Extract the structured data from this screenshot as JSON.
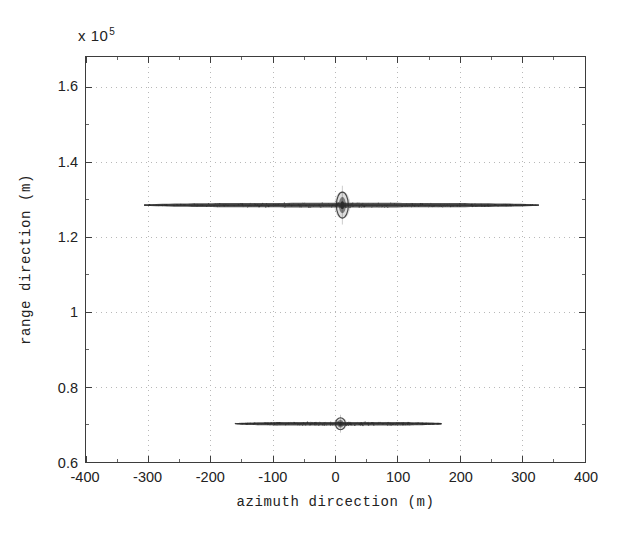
{
  "figure": {
    "title": "",
    "exponent_prefix": "x 10",
    "exponent_power": "5",
    "background_color": "#ffffff",
    "axis_color": "#3d3d3d",
    "grid_color": "#b0b0b0",
    "data_color": "#2b2b2b"
  },
  "chart_data": {
    "type": "scatter",
    "title": "",
    "xlabel": "azimuth dircection  (m)",
    "ylabel": "range direction  (m)",
    "xlim": [
      -400,
      400
    ],
    "ylim": [
      60000,
      168000
    ],
    "y_axis_exponent": 100000,
    "y_exponent_label": "x 10^5",
    "xticks": [
      -400,
      -300,
      -200,
      -100,
      0,
      100,
      200,
      300,
      400
    ],
    "xticklabels": [
      "-400",
      "-300",
      "-200",
      "-100",
      "0",
      "100",
      "200",
      "300",
      "400"
    ],
    "yticks": [
      60000,
      80000,
      100000,
      120000,
      140000,
      160000
    ],
    "yticklabels": [
      "0.6",
      "0.8",
      "1",
      "1.2",
      "1.4",
      "1.6"
    ],
    "grid": true,
    "grid_style": "dotted",
    "legend": null,
    "annotations": [],
    "series": [
      {
        "name": "target-streak-upper",
        "description": "horizontal smeared point-target response at far range",
        "y": 128500,
        "x_start": -307,
        "x_end": 326,
        "core_x": 11,
        "core_half_width_px": 6,
        "core_half_height_px": 13,
        "streak_half_thickness_px": 2.0
      },
      {
        "name": "target-streak-lower",
        "description": "horizontal smeared point-target response at near range",
        "y": 70200,
        "x_start": -161,
        "x_end": 170,
        "core_x": 8,
        "core_half_width_px": 5,
        "core_half_height_px": 6,
        "streak_half_thickness_px": 1.6
      }
    ]
  }
}
